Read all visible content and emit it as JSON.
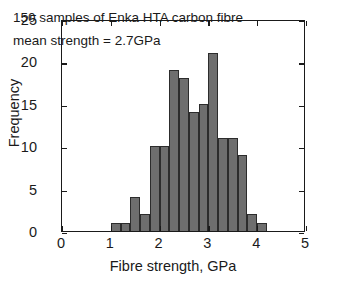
{
  "chart_data": {
    "type": "bar",
    "title": "",
    "subtitle": "",
    "xlabel": "Fibre strength, GPa",
    "ylabel": "Frequency",
    "xlim": [
      0,
      5
    ],
    "ylim": [
      0,
      25
    ],
    "xticks": [
      "0",
      "1",
      "2",
      "3",
      "4",
      "5"
    ],
    "xtick_values": [
      0,
      1,
      2,
      3,
      4,
      5
    ],
    "yticks": [
      "0",
      "5",
      "10",
      "15",
      "20",
      "25"
    ],
    "ytick_values": [
      0,
      5,
      10,
      15,
      20,
      25
    ],
    "grid": false,
    "legend": null,
    "bin_width": 0.2,
    "bin_starts": [
      1.0,
      1.2,
      1.4,
      1.6,
      1.8,
      2.0,
      2.2,
      2.4,
      2.6,
      2.8,
      3.0,
      3.2,
      3.4,
      3.6,
      3.8,
      4.0
    ],
    "categories": [
      "1.0-1.2",
      "1.2-1.4",
      "1.4-1.6",
      "1.6-1.8",
      "1.8-2.0",
      "2.0-2.2",
      "2.2-2.4",
      "2.4-2.6",
      "2.6-2.8",
      "2.8-3.0",
      "3.0-3.2",
      "3.2-3.4",
      "3.4-3.6",
      "3.6-3.8",
      "3.8-4.0",
      "4.0-4.2"
    ],
    "values": [
      1,
      1,
      4,
      2,
      10,
      10,
      19,
      18,
      14,
      15,
      21,
      11,
      11,
      9,
      2,
      1
    ],
    "bar_color": "#6e6e6e",
    "bar_edge_color": "#2c2c2c",
    "annotations": [
      "150 samples of Enka HTA carbon fibre",
      "mean strength = 2.7GPa"
    ],
    "sample_count": 150,
    "mean_strength": "2.7GPa"
  }
}
